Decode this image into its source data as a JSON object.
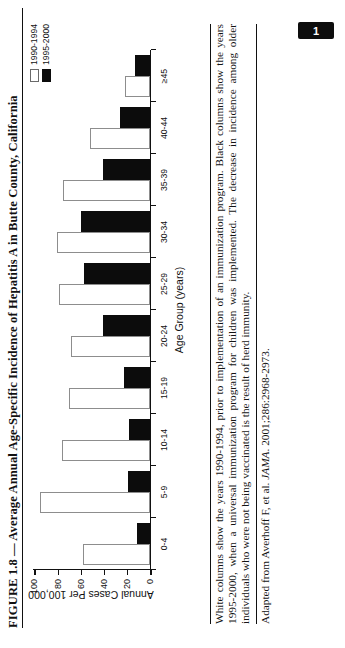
{
  "figure": {
    "title": "FIGURE 1.8 — Average Annual Age-Specific Incidence of Hepatitis A in Butte County, California",
    "caption": "White columns show the years 1990-1994, prior to implementation of an immunization program. Black columns show the years 1995-2000, when a universal immunization program for children was implemented. The decrease in incidence among older individuals who were not being vaccinated is the result of herd immunity.",
    "source": "Adapted from Averhoff F, et al. ",
    "source_italic": "JAMA",
    "source_tail": ". 2001;286:2968-2973."
  },
  "page_badge": {
    "label": "1"
  },
  "legend": {
    "items": [
      {
        "label": "1990-1994",
        "swatch": "white"
      },
      {
        "label": "1995-2000",
        "swatch": "black"
      }
    ]
  },
  "chart_data": {
    "type": "bar",
    "title": "Average Annual Age-Specific Incidence of Hepatitis A in Butte County, California",
    "xlabel": "Age Group (years)",
    "ylabel": "Annual Cases Per 100,000",
    "categories": [
      "0-4",
      "5-9",
      "10-14",
      "15-19",
      "20-24",
      "25-29",
      "30-34",
      "35-39",
      "40-44",
      "≥45"
    ],
    "series": [
      {
        "name": "1990-1994",
        "color": "#ffffff",
        "values": [
          58,
          95,
          76,
          70,
          68,
          78,
          80,
          75,
          52,
          21
        ]
      },
      {
        "name": "1995-2000",
        "color": "#0c0c0c",
        "values": [
          11,
          19,
          18,
          22,
          40,
          57,
          59,
          40,
          26,
          13
        ]
      }
    ],
    "ylim": [
      0,
      100
    ],
    "yticks": [
      0,
      20,
      40,
      60,
      80,
      100
    ],
    "ytick_labels": [
      "0",
      "20",
      "40",
      "60",
      "80",
      "100"
    ],
    "grid": false,
    "legend_position": "top-right"
  }
}
